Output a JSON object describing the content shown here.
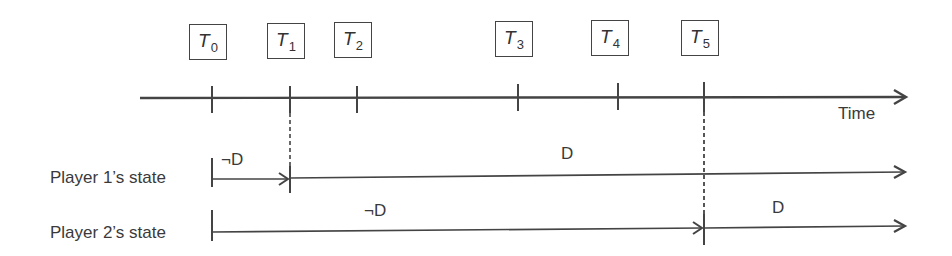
{
  "diagram": {
    "type": "timeline",
    "axis": {
      "label": "Time"
    },
    "time_points": [
      {
        "name": "T",
        "sub": "0",
        "x": 212
      },
      {
        "name": "T",
        "sub": "1",
        "x": 290
      },
      {
        "name": "T",
        "sub": "2",
        "x": 357
      },
      {
        "name": "T",
        "sub": "3",
        "x": 518
      },
      {
        "name": "T",
        "sub": "4",
        "x": 618
      },
      {
        "name": "T",
        "sub": "5",
        "x": 704
      }
    ],
    "rows": [
      {
        "label": "Player 1’s state",
        "segments": [
          {
            "from": "T0",
            "to": "T1",
            "state": "¬D"
          },
          {
            "from": "T1",
            "to": "end",
            "state": "D"
          }
        ]
      },
      {
        "label": "Player 2’s state",
        "segments": [
          {
            "from": "T0",
            "to": "T5",
            "state": "¬D"
          },
          {
            "from": "T5",
            "to": "end",
            "state": "D"
          }
        ]
      }
    ],
    "colors": {
      "line": "#444444",
      "text": "#3a3a3a"
    }
  }
}
